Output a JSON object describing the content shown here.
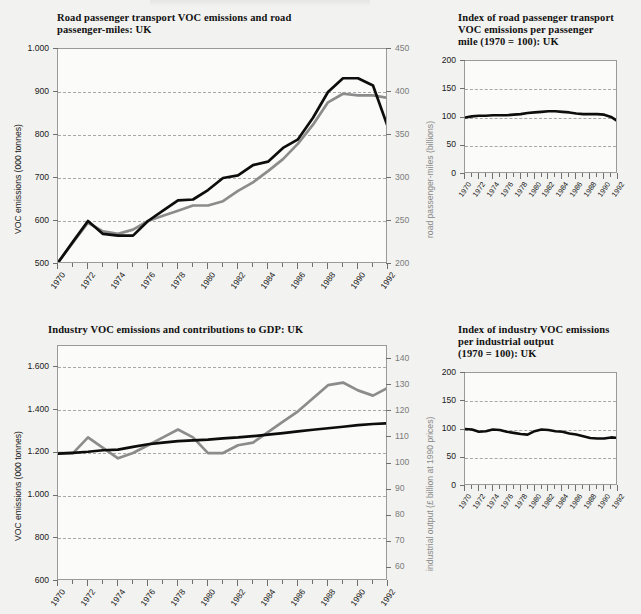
{
  "document": {
    "background_color": "#f2f2f0",
    "series_colors": {
      "dark": "#0d0d0d",
      "grey": "#8c8c8c"
    }
  },
  "charts": [
    {
      "id": "road-passenger-transport",
      "title_line1": "Road passenger transport VOC emissions and road",
      "title_line2": "passenger-miles: UK",
      "chart_data": {
        "type": "line",
        "title": "Road passenger transport VOC emissions and road passenger-miles: UK",
        "xlabel": "",
        "ylabel": "VOC emissions (000 tonnes)",
        "ylabel_right": "road passenger-miles (billions)",
        "ylim": [
          500,
          1000
        ],
        "ylim_right": [
          200,
          450
        ],
        "yticks": [
          "500",
          "600",
          "700",
          "800",
          "900",
          "1.000"
        ],
        "ytick_values": [
          500,
          600,
          700,
          800,
          900,
          1000
        ],
        "yticks_right": [
          "200",
          "250",
          "300",
          "350",
          "400",
          "450"
        ],
        "ytick_values_right": [
          200,
          250,
          300,
          350,
          400,
          450
        ],
        "grid": true,
        "legend": "none",
        "x": [
          1970,
          1971,
          1972,
          1973,
          1974,
          1975,
          1976,
          1977,
          1978,
          1979,
          1980,
          1981,
          1982,
          1983,
          1984,
          1985,
          1986,
          1987,
          1988,
          1989,
          1990,
          1991,
          1992
        ],
        "xticks": [
          "1970",
          "1972",
          "1974",
          "1976",
          "1978",
          "1980",
          "1982",
          "1984",
          "1986",
          "1988",
          "1990",
          "1992"
        ],
        "series": [
          {
            "name": "VOC emissions (000 tonnes)",
            "axis": "left",
            "color": "#0d0d0d",
            "values": [
              503,
              552,
              600,
              570,
              566,
              566,
              600,
              624,
              648,
              650,
              672,
              700,
              706,
              730,
              738,
              770,
              790,
              840,
              900,
              932,
              932,
              915,
              818
            ]
          },
          {
            "name": "road passenger-miles (billions)",
            "axis": "right",
            "color": "#8c8c8c",
            "values": [
              202,
              225,
              248,
              238,
              235,
              240,
              250,
              256,
              262,
              268,
              268,
              273,
              285,
              295,
              308,
              322,
              340,
              362,
              388,
              398,
              396,
              396,
              393
            ]
          }
        ]
      }
    },
    {
      "id": "index-road-passenger",
      "title_line1": "Index of road passenger transport",
      "title_line2": "VOC emissions per passenger",
      "title_line3": "mile (1970 = 100): UK",
      "chart_data": {
        "type": "line",
        "title": "Index of road passenger transport VOC emissions per passenger mile (1970 = 100): UK",
        "xlabel": "",
        "ylabel": "",
        "ylim": [
          0,
          200
        ],
        "yticks": [
          "0",
          "50",
          "100",
          "150",
          "200"
        ],
        "ytick_values": [
          0,
          50,
          100,
          150,
          200
        ],
        "grid": true,
        "legend": "none",
        "x": [
          1970,
          1971,
          1972,
          1973,
          1974,
          1975,
          1976,
          1977,
          1978,
          1979,
          1980,
          1981,
          1982,
          1983,
          1984,
          1985,
          1986,
          1987,
          1988,
          1989,
          1990,
          1991,
          1992
        ],
        "xticks": [
          "1970",
          "1972",
          "1974",
          "1976",
          "1978",
          "1980",
          "1982",
          "1984",
          "1986",
          "1988",
          "1990",
          "1992"
        ],
        "series": [
          {
            "name": "Index (1970 = 100)",
            "axis": "left",
            "color": "#0d0d0d",
            "values": [
              100,
              102,
              103,
              103,
              104,
              104,
              104,
              105,
              106,
              108,
              109,
              110,
              111,
              111,
              110,
              109,
              107,
              106,
              106,
              106,
              105,
              101,
              93
            ]
          }
        ]
      }
    },
    {
      "id": "industry-voc-gdp",
      "title_line1": "Industry VOC emissions and contributions to GDP: UK",
      "chart_data": {
        "type": "line",
        "title": "Industry VOC emissions and contributions to GDP: UK",
        "xlabel": "",
        "ylabel": "VOC emissions (000 tonnes)",
        "ylabel_right": "industrial output (£ billion at 1990 prices)",
        "ylim": [
          600,
          1700
        ],
        "ylim_right": [
          55,
          145
        ],
        "yticks": [
          "600",
          "800",
          "1.000",
          "1.200",
          "1.400",
          "1.600"
        ],
        "ytick_values": [
          600,
          800,
          1000,
          1200,
          1400,
          1600
        ],
        "yticks_right": [
          "60",
          "70",
          "80",
          "90",
          "100",
          "110",
          "120",
          "130",
          "140"
        ],
        "ytick_values_right": [
          60,
          70,
          80,
          90,
          100,
          110,
          120,
          130,
          140
        ],
        "grid": true,
        "legend": "none",
        "x": [
          1970,
          1971,
          1972,
          1973,
          1974,
          1975,
          1976,
          1977,
          1978,
          1979,
          1980,
          1981,
          1982,
          1983,
          1984,
          1985,
          1986,
          1987,
          1988,
          1989,
          1990,
          1991,
          1992
        ],
        "xticks": [
          "1970",
          "1972",
          "1974",
          "1976",
          "1978",
          "1980",
          "1982",
          "1984",
          "1986",
          "1988",
          "1990",
          "1992"
        ],
        "series": [
          {
            "name": "VOC emissions (000 tonnes)",
            "axis": "left",
            "color": "#0d0d0d",
            "values": [
              1196,
              1200,
              1205,
              1212,
              1215,
              1228,
              1240,
              1248,
              1255,
              1258,
              1262,
              1268,
              1272,
              1278,
              1285,
              1292,
              1300,
              1308,
              1315,
              1322,
              1330,
              1335,
              1338
            ]
          },
          {
            "name": "industrial output (£ billion at 1990 prices)",
            "axis": "right",
            "color": "#8c8c8c",
            "values": [
              104,
              104,
              110,
              106,
              102,
              104,
              107,
              110,
              113,
              110,
              104,
              104,
              107,
              108,
              112,
              116,
              120,
              125,
              130,
              131,
              128,
              126,
              129
            ]
          }
        ]
      }
    },
    {
      "id": "index-industry-voc",
      "title_line1": "Index of industry VOC emissions",
      "title_line2": "per industrial output",
      "title_line3": "(1970 = 100): UK",
      "chart_data": {
        "type": "line",
        "title": "Index of industry VOC emissions per industrial output (1970 = 100): UK",
        "xlabel": "",
        "ylabel": "",
        "ylim": [
          0,
          200
        ],
        "yticks": [
          "0",
          "50",
          "100",
          "150",
          "200"
        ],
        "ytick_values": [
          0,
          50,
          100,
          150,
          200
        ],
        "grid": true,
        "legend": "none",
        "x": [
          1970,
          1971,
          1972,
          1973,
          1974,
          1975,
          1976,
          1977,
          1978,
          1979,
          1980,
          1981,
          1982,
          1983,
          1984,
          1985,
          1986,
          1987,
          1988,
          1989,
          1990,
          1991,
          1992
        ],
        "xticks": [
          "1970",
          "1972",
          "1974",
          "1976",
          "1978",
          "1980",
          "1982",
          "1984",
          "1986",
          "1988",
          "1990",
          "1992"
        ],
        "series": [
          {
            "name": "Index (1970 = 100)",
            "axis": "left",
            "color": "#0d0d0d",
            "values": [
              101,
              100,
              96,
              97,
              100,
              99,
              96,
              94,
              92,
              91,
              97,
              100,
              99,
              97,
              96,
              93,
              91,
              88,
              85,
              84,
              84,
              86,
              85
            ]
          }
        ]
      }
    }
  ]
}
